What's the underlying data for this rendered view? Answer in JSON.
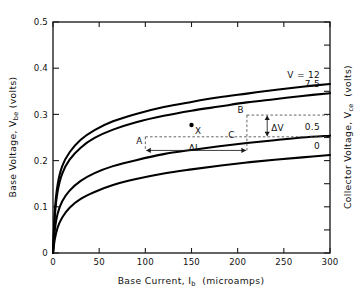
{
  "chart_data": {
    "type": "line",
    "title": "",
    "xlabel": "Base Current, Ib (microamps)",
    "xlabel_main": "Base Current, I",
    "xlabel_sub": "b",
    "xlabel_tail": "(microamps)",
    "ylabel": "Base Voltage, Vbe (volts)",
    "ylabel_main": "Base Voltage, V",
    "ylabel_sub": "be",
    "ylabel_tail": "(volts)",
    "y2label": "Collector Voltage, Vce (volts)",
    "y2label_main": "Collector Voltage, V",
    "y2label_sub": "ce",
    "y2label_tail": "(volts)",
    "xlim": [
      0,
      300
    ],
    "ylim": [
      0,
      0.5
    ],
    "xticks": [
      0,
      50,
      100,
      150,
      200,
      250,
      300
    ],
    "xtick_labels": [
      "0",
      "50",
      "100",
      "150",
      "200",
      "250",
      "300"
    ],
    "yticks": [
      0,
      0.1,
      0.2,
      0.3,
      0.4,
      0.5
    ],
    "ytick_labels": [
      "0",
      "0.1",
      "0.2",
      "0.3",
      "0.4",
      "0.5"
    ],
    "grid": false,
    "legend_position": "inline-right-of-curves",
    "series": [
      {
        "name": "V = 12",
        "label": "V = 12",
        "x": [
          0,
          2,
          5,
          10,
          18,
          30,
          45,
          65,
          90,
          120,
          150,
          180,
          210,
          240,
          270,
          300
        ],
        "y": [
          0.0,
          0.092,
          0.148,
          0.188,
          0.218,
          0.245,
          0.266,
          0.285,
          0.301,
          0.316,
          0.327,
          0.337,
          0.345,
          0.353,
          0.36,
          0.366
        ]
      },
      {
        "name": "V = 7.5",
        "label": "7.5",
        "x": [
          0,
          2,
          5,
          10,
          18,
          30,
          45,
          65,
          90,
          120,
          150,
          180,
          210,
          240,
          270,
          300
        ],
        "y": [
          0.0,
          0.08,
          0.133,
          0.172,
          0.202,
          0.228,
          0.249,
          0.267,
          0.283,
          0.297,
          0.308,
          0.317,
          0.326,
          0.333,
          0.34,
          0.346
        ]
      },
      {
        "name": "V = 0.5",
        "label": "0.5",
        "x": [
          0,
          2,
          5,
          10,
          18,
          30,
          45,
          65,
          90,
          120,
          150,
          180,
          210,
          240,
          270,
          300
        ],
        "y": [
          0.0,
          0.05,
          0.085,
          0.112,
          0.135,
          0.156,
          0.173,
          0.188,
          0.201,
          0.214,
          0.223,
          0.231,
          0.238,
          0.244,
          0.25,
          0.254
        ]
      },
      {
        "name": "V = 0",
        "label": "0",
        "x": [
          0,
          2,
          5,
          10,
          18,
          30,
          45,
          65,
          90,
          120,
          150,
          180,
          210,
          240,
          270,
          300
        ],
        "y": [
          0.0,
          0.03,
          0.055,
          0.077,
          0.098,
          0.117,
          0.132,
          0.147,
          0.16,
          0.172,
          0.181,
          0.189,
          0.196,
          0.202,
          0.207,
          0.212
        ]
      }
    ],
    "annotations": [
      {
        "name": "point-x",
        "label": "X",
        "x": 150,
        "y": 0.277,
        "marker": "dot"
      },
      {
        "name": "point-a",
        "label": "A",
        "x": 100,
        "y": 0.2515,
        "marker": "none"
      },
      {
        "name": "point-b",
        "label": "B",
        "x": 210,
        "y": 0.2985,
        "marker": "none"
      },
      {
        "name": "point-c",
        "label": "C",
        "x": 200,
        "y": 0.2575,
        "marker": "none"
      },
      {
        "name": "delta-v",
        "label": "ΔV",
        "x": 232,
        "y": 0.272,
        "marker": "arrow-vertical"
      },
      {
        "name": "delta-i",
        "label": "ΔI",
        "x": 152,
        "y": 0.229,
        "marker": "arrow-horizontal"
      }
    ]
  }
}
